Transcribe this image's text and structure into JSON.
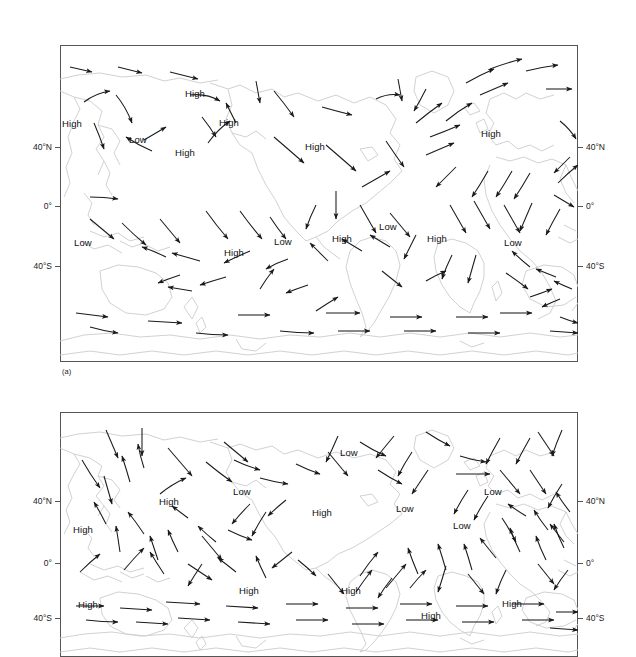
{
  "figure": {
    "background_color": "#ffffff",
    "coastline_color": "#c9c9c9",
    "arrow_color": "#1a1a1a",
    "frame_color": "#555555"
  },
  "panels": [
    {
      "tag": "(a)",
      "frame": {
        "x": 60,
        "y": 45,
        "w": 518,
        "h": 317
      },
      "axis_ticks": [
        {
          "label": "40°N",
          "y": 147
        },
        {
          "label": "0°",
          "y": 206
        },
        {
          "label": "40°S",
          "y": 266
        }
      ],
      "pressure_labels": [
        {
          "text": "High",
          "x": 62,
          "y": 119
        },
        {
          "text": "Low",
          "x": 129,
          "y": 135
        },
        {
          "text": "High",
          "x": 185,
          "y": 104
        },
        {
          "text": "High",
          "x": 175,
          "y": 153
        },
        {
          "text": "High",
          "x": 219,
          "y": 124
        },
        {
          "text": "High",
          "x": 305,
          "y": 146
        },
        {
          "text": "High",
          "x": 481,
          "y": 129
        },
        {
          "text": "Low",
          "x": 74,
          "y": 240
        },
        {
          "text": "High",
          "x": 224,
          "y": 252
        },
        {
          "text": "Low",
          "x": 276,
          "y": 241
        },
        {
          "text": "High",
          "x": 334,
          "y": 238
        },
        {
          "text": "Low",
          "x": 381,
          "y": 222
        },
        {
          "text": "High",
          "x": 428,
          "y": 238
        },
        {
          "text": "Low",
          "x": 506,
          "y": 241
        }
      ]
    },
    {
      "tag": "",
      "frame": {
        "x": 60,
        "y": 412,
        "w": 518,
        "h": 245
      },
      "axis_ticks": [
        {
          "label": "40°N",
          "y": 501
        },
        {
          "label": "0°",
          "y": 563
        },
        {
          "label": "40°S",
          "y": 618
        }
      ],
      "pressure_labels": [
        {
          "text": "High",
          "x": 160,
          "y": 500
        },
        {
          "text": "Low",
          "x": 234,
          "y": 492
        },
        {
          "text": "Low",
          "x": 340,
          "y": 450
        },
        {
          "text": "High",
          "x": 312,
          "y": 510
        },
        {
          "text": "Low",
          "x": 369,
          "y": 462
        },
        {
          "text": "Low",
          "x": 453,
          "y": 521
        },
        {
          "text": "Low",
          "x": 489,
          "y": 493
        },
        {
          "text": "High",
          "x": 479,
          "y": 497
        },
        {
          "text": "High",
          "x": 78,
          "y": 602
        },
        {
          "text": "High",
          "x": 239,
          "y": 588
        },
        {
          "text": "High",
          "x": 343,
          "y": 588
        },
        {
          "text": "High",
          "x": 422,
          "y": 612
        },
        {
          "text": "High",
          "x": 504,
          "y": 601
        }
      ]
    }
  ],
  "panel_a_label": "(a)",
  "axis_label_names": [
    "40°N",
    "0°",
    "40°S"
  ]
}
